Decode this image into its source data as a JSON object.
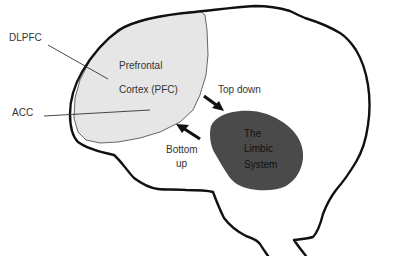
{
  "diagram": {
    "regions": {
      "pfc": {
        "line1": "Prefrontal",
        "line2": "Cortex (PFC)",
        "fill": "#e6e6e6"
      },
      "limbic": {
        "line1": "The",
        "line2": "Limbic",
        "line3": "System",
        "fill": "#4a4a4a"
      }
    },
    "callouts": {
      "dlpfc": "DLPFC",
      "acc": "ACC"
    },
    "arrows": {
      "top_down": "Top down",
      "bottom_up_line1": "Bottom",
      "bottom_up_line2": "up"
    },
    "colors": {
      "outline": "#111111",
      "pfc_fill": "#e6e6e6",
      "limbic_fill": "#4a4a4a",
      "text": "#333333"
    }
  }
}
